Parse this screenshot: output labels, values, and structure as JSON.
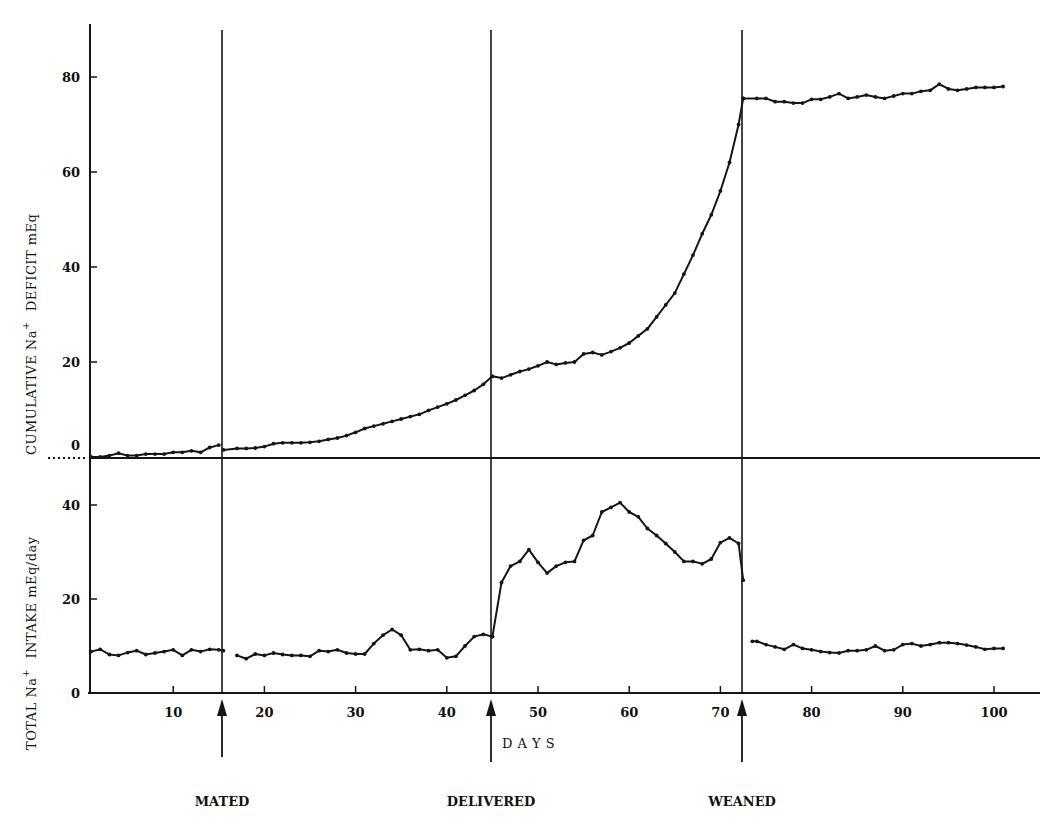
{
  "chart_data": {
    "type": "line",
    "panels": [
      {
        "name": "cumulative_deficit",
        "ylabel": "CUMULATIVE Na+ DEFICIT mEq",
        "ylabel_parts": [
          "CUMULATIVE Na",
          "+",
          "DEFICIT mEq"
        ],
        "yticks": [
          0,
          20,
          40,
          60,
          80
        ],
        "ytick_labels": [
          "0",
          "20",
          "40",
          "60",
          "80"
        ],
        "ylim": [
          -1,
          92
        ],
        "segments": [
          {
            "x": [
              1,
              2,
              3,
              4,
              5,
              6,
              7,
              8,
              9,
              10,
              11,
              12,
              13,
              14,
              15
            ],
            "y": [
              0,
              0,
              0.3,
              0.8,
              0.3,
              0.3,
              0.6,
              0.6,
              0.6,
              1.0,
              1.0,
              1.3,
              1.0,
              2.0,
              2.5
            ]
          },
          {
            "x": [
              15.5,
              17,
              18,
              19,
              20,
              21,
              22,
              23,
              24,
              25,
              26,
              27,
              28,
              29,
              30,
              31,
              32,
              33,
              34,
              35,
              36,
              37,
              38,
              39,
              40,
              41,
              42,
              43,
              44,
              45
            ],
            "y": [
              1.5,
              1.8,
              1.8,
              1.9,
              2.2,
              2.8,
              3.0,
              3.0,
              3.0,
              3.1,
              3.3,
              3.7,
              4.0,
              4.5,
              5.2,
              6.0,
              6.5,
              7.0,
              7.5,
              8.0,
              8.5,
              9.0,
              9.8,
              10.5,
              11.2,
              12.0,
              13.0,
              14.0,
              15.3,
              17.0
            ]
          },
          {
            "x": [
              45,
              46,
              47,
              48,
              49,
              50,
              51,
              52,
              53,
              54,
              55,
              56,
              57,
              58,
              59,
              60,
              61,
              62,
              63,
              64,
              65,
              66,
              67,
              68,
              69,
              70,
              71,
              72,
              72.5
            ],
            "y": [
              17.0,
              16.6,
              17.3,
              18.0,
              18.5,
              19.2,
              20.0,
              19.5,
              19.8,
              20.0,
              21.7,
              22.0,
              21.5,
              22.2,
              23.0,
              24.0,
              25.5,
              27.0,
              29.5,
              32.0,
              34.5,
              38.5,
              42.5,
              47.0,
              51.0,
              56.0,
              62.0,
              70.0,
              75.5
            ]
          },
          {
            "x": [
              72.5,
              74,
              75,
              76,
              77,
              78,
              79,
              80,
              81,
              82,
              83,
              84,
              85,
              86,
              87,
              88,
              89,
              90,
              91,
              92,
              93,
              94,
              95,
              96,
              97,
              98,
              99,
              100,
              101
            ],
            "y": [
              75.5,
              75.5,
              75.5,
              74.8,
              74.8,
              74.5,
              74.5,
              75.3,
              75.3,
              75.8,
              76.5,
              75.5,
              75.8,
              76.2,
              75.8,
              75.5,
              76.0,
              76.5,
              76.5,
              77.0,
              77.2,
              78.5,
              77.5,
              77.2,
              77.5,
              77.8,
              77.8,
              77.8,
              78.0
            ]
          }
        ]
      },
      {
        "name": "total_intake",
        "ylabel": "TOTAL Na+ INTAKE mEq/day",
        "ylabel_parts": [
          "TOTAL Na",
          "+",
          "INTAKE mEq/day"
        ],
        "yticks": [
          0,
          20,
          40
        ],
        "ytick_labels": [
          "0",
          "20",
          "40"
        ],
        "ylim": [
          0,
          50
        ],
        "segments": [
          {
            "x": [
              1,
              2,
              3,
              4,
              5,
              6,
              7,
              8,
              9,
              10,
              11,
              12,
              13,
              14,
              15,
              15.5
            ],
            "y": [
              8.8,
              9.3,
              8.2,
              8.0,
              8.6,
              9.0,
              8.2,
              8.5,
              8.8,
              9.2,
              8.0,
              9.2,
              8.8,
              9.3,
              9.2,
              9.0
            ]
          },
          {
            "x": [
              17,
              18,
              19,
              20,
              21,
              22,
              23,
              24,
              25,
              26,
              27,
              28,
              29,
              30,
              31,
              32,
              33,
              34,
              35,
              36,
              37,
              38,
              39,
              40,
              41,
              42,
              43,
              44,
              45
            ],
            "y": [
              8.0,
              7.3,
              8.3,
              8.0,
              8.5,
              8.2,
              8.0,
              8.0,
              7.8,
              9.0,
              8.8,
              9.2,
              8.5,
              8.3,
              8.3,
              10.5,
              12.3,
              13.5,
              12.3,
              9.2,
              9.3,
              9.0,
              9.2,
              7.5,
              7.8,
              10.0,
              12.0,
              12.5,
              12.0
            ]
          },
          {
            "x": [
              45,
              46,
              47,
              48,
              49,
              50,
              51,
              52,
              53,
              54,
              55,
              56,
              57,
              58,
              59,
              60,
              61,
              62,
              63,
              64,
              65,
              66,
              67,
              68,
              69,
              70,
              71,
              72,
              72.5
            ],
            "y": [
              12.0,
              23.5,
              27.0,
              28.0,
              30.5,
              27.8,
              25.5,
              27.0,
              27.8,
              28.0,
              32.5,
              33.5,
              38.5,
              39.5,
              40.5,
              38.5,
              37.5,
              35.0,
              33.5,
              31.8,
              30.0,
              28.0,
              28.0,
              27.5,
              28.5,
              32.0,
              33.0,
              31.8,
              24.0
            ]
          },
          {
            "x": [
              73.5,
              74,
              75,
              76,
              77,
              78,
              79,
              80,
              81,
              82,
              83,
              84,
              85,
              86,
              87,
              88,
              89,
              90,
              91,
              92,
              93,
              94,
              95,
              96,
              97,
              98,
              99,
              100,
              101
            ],
            "y": [
              11.0,
              11.0,
              10.3,
              9.8,
              9.3,
              10.3,
              9.5,
              9.2,
              8.8,
              8.6,
              8.5,
              9.0,
              9.0,
              9.2,
              10.0,
              9.0,
              9.2,
              10.3,
              10.5,
              10.0,
              10.3,
              10.7,
              10.7,
              10.5,
              10.2,
              9.8,
              9.3,
              9.5,
              9.5
            ]
          }
        ]
      }
    ],
    "xlabel": "D A Y S",
    "xticks": [
      10,
      20,
      30,
      40,
      50,
      60,
      70,
      80,
      90,
      100
    ],
    "xtick_labels": [
      "10",
      "20",
      "30",
      "40",
      "50",
      "60",
      "70",
      "80",
      "90",
      "100"
    ],
    "xlim": [
      0,
      105
    ],
    "events": [
      {
        "label": "MATED",
        "day": 15.4
      },
      {
        "label": "DELIVERED",
        "day": 45
      },
      {
        "label": "WEANED",
        "day": 72.5
      }
    ],
    "grid": false,
    "legend": null
  }
}
